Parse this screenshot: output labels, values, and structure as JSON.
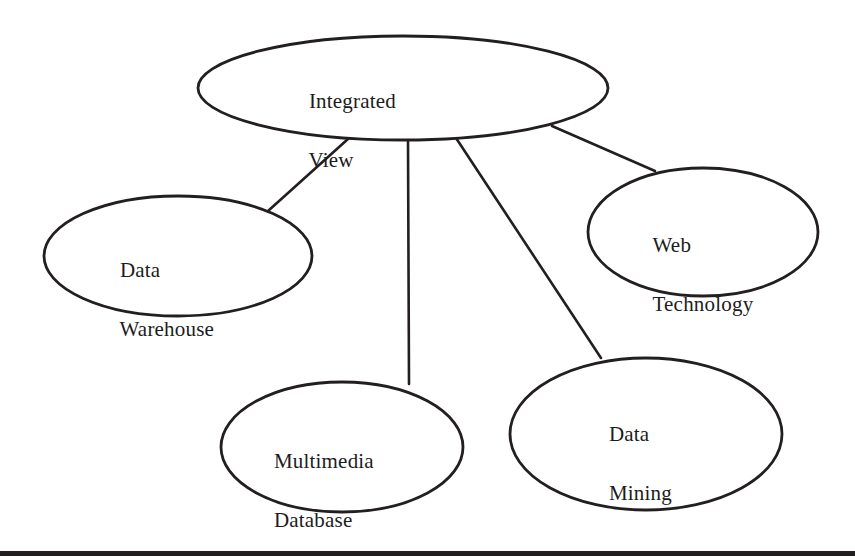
{
  "diagram": {
    "type": "concept-map",
    "title_node": "Integrated View",
    "stroke_color": "#231f20",
    "background_color": "#ffffff",
    "nodes": [
      {
        "id": "integrated-view",
        "label": "Integrated\nView",
        "line1": "Integrated",
        "line2": "View",
        "shape": "ellipse",
        "cx": 403,
        "cy": 88,
        "rx": 205,
        "ry": 52,
        "label_x": 298,
        "label_y": 57
      },
      {
        "id": "data-warehouse",
        "label": "Data\nWarehouse",
        "line1": "Data",
        "line2": "Warehouse",
        "shape": "ellipse",
        "cx": 178,
        "cy": 256,
        "rx": 134,
        "ry": 60,
        "label_x": 109,
        "label_y": 226
      },
      {
        "id": "web-technology",
        "label": "Web\nTechnology",
        "line1": "Web",
        "line2": "Technology",
        "shape": "ellipse",
        "cx": 703,
        "cy": 232,
        "rx": 115,
        "ry": 64,
        "label_x": 642,
        "label_y": 201
      },
      {
        "id": "multimedia-database",
        "label": "Multimedia\nDatabase",
        "line1": "Multimedia",
        "line2": "Database",
        "shape": "ellipse",
        "cx": 342,
        "cy": 447,
        "rx": 121,
        "ry": 65,
        "label_x": 263,
        "label_y": 417
      },
      {
        "id": "data-mining",
        "label": "Data\nMining",
        "line1": "Data",
        "line2": "Mining",
        "shape": "ellipse",
        "cx": 646,
        "cy": 434,
        "rx": 136,
        "ry": 76,
        "label_x": 598,
        "label_y": 390
      }
    ],
    "edges": [
      {
        "id": "edge-integrated-view-data-warehouse",
        "from": "integrated-view",
        "to": "data-warehouse",
        "x1": 348,
        "y1": 139,
        "x2": 268,
        "y2": 211
      },
      {
        "id": "edge-integrated-view-multimedia",
        "from": "integrated-view",
        "to": "multimedia-database",
        "x1": 408,
        "y1": 140,
        "x2": 409,
        "y2": 384
      },
      {
        "id": "edge-integrated-view-data-mining",
        "from": "integrated-view",
        "to": "data-mining",
        "x1": 456,
        "y1": 138,
        "x2": 601,
        "y2": 358
      },
      {
        "id": "edge-integrated-view-web-technology",
        "from": "integrated-view",
        "to": "web-technology",
        "x1": 552,
        "y1": 126,
        "x2": 655,
        "y2": 171
      }
    ],
    "bottom_rule": {
      "label": "page-divider-rule",
      "x": 0,
      "y": 551,
      "width": 855,
      "height": 5
    }
  }
}
